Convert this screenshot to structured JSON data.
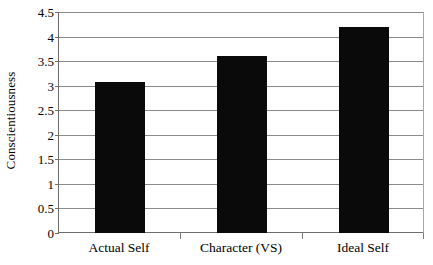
{
  "chart_data": {
    "type": "bar",
    "title": "",
    "subtitle": "",
    "xlabel": "",
    "ylabel": "Conscientiousness",
    "categories": [
      "Actual Self",
      "Character (VS)",
      "Ideal Self"
    ],
    "values": [
      3.07,
      3.61,
      4.19
    ],
    "series": [
      {
        "name": "Conscientiousness",
        "values": [
          3.07,
          3.61,
          4.19
        ]
      }
    ],
    "ylim": [
      0,
      4.5
    ],
    "ytick_labels": [
      "0",
      "0.5",
      "1",
      "1.5",
      "2",
      "2.5",
      "3",
      "3.5",
      "4",
      "4.5"
    ],
    "ytick_values": [
      0,
      0.5,
      1,
      1.5,
      2,
      2.5,
      3,
      3.5,
      4,
      4.5
    ],
    "grid": "horizontal",
    "legend": "none",
    "bar_color": "#0a0a0a",
    "gridline_color": "#8a8a8a",
    "axis_color": "#6e6e6e",
    "background_color": "#ffffff"
  }
}
